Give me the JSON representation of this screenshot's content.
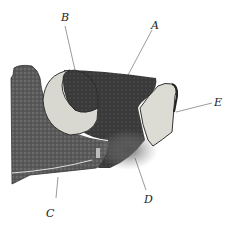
{
  "figure": {
    "labels": [
      {
        "id": "A",
        "text": "A",
        "x": 151,
        "y": 20
      },
      {
        "id": "B",
        "text": "B",
        "x": 61,
        "y": 12
      },
      {
        "id": "C",
        "text": "C",
        "x": 46,
        "y": 208
      },
      {
        "id": "D",
        "text": "D",
        "x": 144,
        "y": 194
      },
      {
        "id": "E",
        "text": "E",
        "x": 214,
        "y": 97
      }
    ]
  }
}
